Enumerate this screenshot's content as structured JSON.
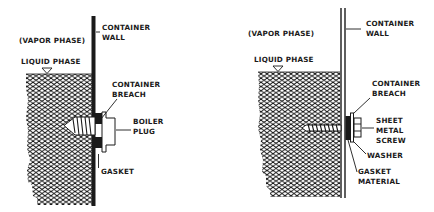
{
  "diagrams": [
    {
      "id": "boiler-plug-repair",
      "labels": {
        "container_wall": [
          "CONTAINER",
          "WALL"
        ],
        "vapor_phase": "(VAPOR PHASE)",
        "liquid_phase": "LIQUID PHASE",
        "container_breach": [
          "CONTAINER",
          "BREACH"
        ],
        "plug": [
          "BOILER",
          "PLUG"
        ],
        "gasket": [
          "GASKET"
        ]
      }
    },
    {
      "id": "sheet-metal-screw-repair",
      "labels": {
        "container_wall": [
          "CONTAINER",
          "WALL"
        ],
        "vapor_phase": "(VAPOR PHASE)",
        "liquid_phase": "LIQUID PHASE",
        "container_breach": [
          "CONTAINER",
          "BREACH"
        ],
        "screw": [
          "SHEET",
          "METAL",
          "SCREW"
        ],
        "washer": [
          "WASHER"
        ],
        "gasket": [
          "GASKET",
          "MATERIAL"
        ]
      }
    }
  ],
  "colors": {
    "ink": "#1a1a1a",
    "paper": "#ffffff"
  }
}
